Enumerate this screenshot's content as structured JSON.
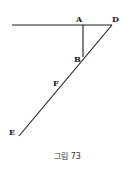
{
  "figure": {
    "caption": "그림 73",
    "line_color": "#1a1a1a",
    "points": {
      "A": "A",
      "B": "B",
      "D": "D",
      "E": "E",
      "F": "F"
    },
    "segments": [
      {
        "from": "horizontal-left",
        "to": "D"
      },
      {
        "from": "A",
        "to": "B"
      },
      {
        "from": "D",
        "to": "E"
      }
    ]
  }
}
